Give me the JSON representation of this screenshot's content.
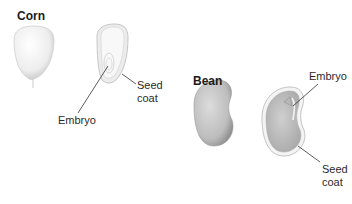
{
  "diagram": {
    "corn": {
      "title": "Corn",
      "labels": {
        "embryo": "Embryo",
        "seed_coat_line1": "Seed",
        "seed_coat_line2": "coat"
      }
    },
    "bean": {
      "title": "Bean",
      "labels": {
        "embryo": "Embryo",
        "seed_coat_line1": "Seed",
        "seed_coat_line2": "coat"
      }
    }
  },
  "colors": {
    "background": "#ffffff",
    "corn_seed": "#f2f2f2",
    "corn_seed_shade": "#c8c8c8",
    "bean_seed": "#c9c9c9",
    "bean_seed_shade": "#8f8f8f",
    "leader_line": "#333333"
  }
}
